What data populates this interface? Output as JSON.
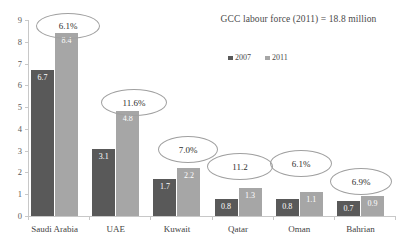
{
  "chart_data": {
    "type": "bar",
    "title": "GCC labour force (2011) = 18.8 million",
    "xlabel": "",
    "ylabel": "",
    "ylim": [
      0,
      9
    ],
    "ytick_step": 1,
    "yticks": [
      "0",
      "1",
      "2",
      "3",
      "4",
      "5",
      "6",
      "7",
      "8",
      "9"
    ],
    "grid": false,
    "legend_position": "top-right",
    "categories": [
      "Saudi Arabia",
      "UAE",
      "Kuwait",
      "Qatar",
      "Oman",
      "Bahrian"
    ],
    "series": [
      {
        "name": "2007",
        "color": "#595959",
        "values": [
          6.7,
          3.1,
          1.7,
          0.8,
          0.8,
          0.7
        ],
        "labels": [
          "6.7",
          "3.1",
          "1.7",
          "0.8",
          "0.8",
          "0.7"
        ]
      },
      {
        "name": "2011",
        "color": "#a6a6a6",
        "values": [
          8.4,
          4.8,
          2.2,
          1.3,
          1.1,
          0.9
        ],
        "labels": [
          "8.4",
          "4.8",
          "2.2",
          "1.3",
          "1.1",
          "0.9"
        ]
      }
    ],
    "annotations": [
      {
        "category": "Saudi Arabia",
        "text": "6.1%"
      },
      {
        "category": "UAE",
        "text": "11.6%"
      },
      {
        "category": "Kuwait",
        "text": "7.0%"
      },
      {
        "category": "Qatar",
        "text": "11.2"
      },
      {
        "category": "Oman",
        "text": "6.1%"
      },
      {
        "category": "Bahrian",
        "text": "6.9%"
      }
    ]
  },
  "colors": {
    "series_2007": "#595959",
    "series_2011": "#a6a6a6",
    "axis": "#c8c8c8",
    "callout_border": "#a0a0a0",
    "text": "#3f3f3f",
    "background": "#ffffff"
  },
  "legend": {
    "entries": [
      {
        "label": "2007"
      },
      {
        "label": "2011"
      }
    ]
  },
  "axis": {
    "y_labels": [
      "9",
      "8",
      "7",
      "6",
      "5",
      "4",
      "3",
      "2",
      "1",
      "0"
    ]
  }
}
